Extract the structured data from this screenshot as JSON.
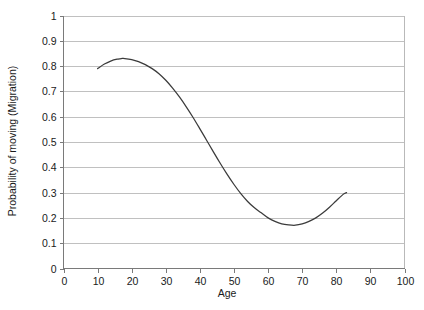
{
  "chart_data": {
    "type": "line",
    "title": "",
    "xlabel": "Age",
    "ylabel": "Probability of moving (Migration)",
    "xlim": [
      0,
      100
    ],
    "ylim": [
      0,
      1
    ],
    "grid": true,
    "legend": false,
    "x_ticks": [
      "0",
      "10",
      "20",
      "30",
      "40",
      "50",
      "60",
      "70",
      "80",
      "90",
      "100"
    ],
    "y_ticks": [
      "0",
      "0.1",
      "0.2",
      "0.3",
      "0.4",
      "0.5",
      "0.6",
      "0.7",
      "0.8",
      "0.9",
      "1"
    ],
    "x_tick_values": [
      0,
      10,
      20,
      30,
      40,
      50,
      60,
      70,
      80,
      90,
      100
    ],
    "y_tick_values": [
      0,
      0.1,
      0.2,
      0.3,
      0.4,
      0.5,
      0.6,
      0.7,
      0.8,
      0.9,
      1
    ],
    "series": [
      {
        "name": "Probability of moving",
        "line_color": "#3b3b3b",
        "x": [
          10,
          12,
          14,
          16,
          17,
          18,
          20,
          22,
          24,
          26,
          28,
          30,
          32,
          34,
          36,
          38,
          40,
          42,
          44,
          46,
          48,
          50,
          52,
          54,
          56,
          58,
          60,
          62,
          64,
          66,
          68,
          70,
          72,
          74,
          76,
          78,
          80,
          82,
          83
        ],
        "y": [
          0.79,
          0.808,
          0.821,
          0.828,
          0.83,
          0.83,
          0.826,
          0.818,
          0.806,
          0.79,
          0.77,
          0.744,
          0.713,
          0.678,
          0.639,
          0.597,
          0.552,
          0.506,
          0.46,
          0.415,
          0.372,
          0.332,
          0.296,
          0.265,
          0.24,
          0.22,
          0.2,
          0.186,
          0.176,
          0.172,
          0.171,
          0.176,
          0.186,
          0.2,
          0.219,
          0.242,
          0.268,
          0.293,
          0.3
        ]
      }
    ],
    "annotations": {
      "peak_age": 17,
      "peak_value": 0.83,
      "trough_age": 66,
      "trough_value": 0.171,
      "start_age": 10,
      "start_value": 0.79,
      "end_age": 83,
      "end_value": 0.3
    },
    "colors": {
      "curve": "#3b3b3b",
      "gridline": "#b9b9b9",
      "axis": "#7a7a7a",
      "text": "#1a1a1a",
      "background": "#ffffff"
    }
  }
}
